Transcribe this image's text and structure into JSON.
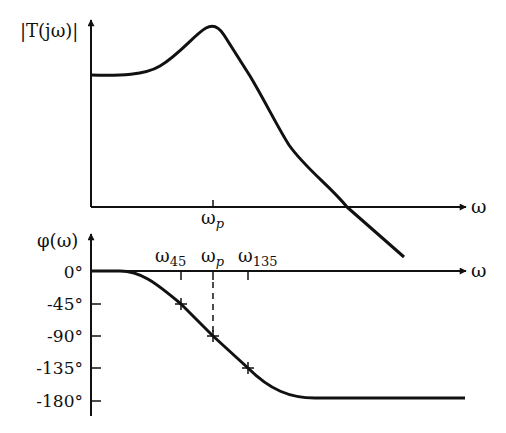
{
  "figure": {
    "type": "bode-plot-sketch",
    "magnitude_plot": {
      "ylabel": "|T(jω)|",
      "xlabel": "ω",
      "tick_label": "ωp",
      "curve": "flat low-frequency gain, resonant peak at ωp, then roll-off crossing the axis"
    },
    "phase_plot": {
      "ylabel": "φ(ω)",
      "xlabel": "ω",
      "y_ticks": [
        "0°",
        "-45°",
        "-90°",
        "-135°",
        "-180°"
      ],
      "x_ticks": [
        "ω45",
        "ωp",
        "ω135"
      ],
      "marked_points": [
        {
          "x": "ω45",
          "phase": "-45°"
        },
        {
          "x": "ωp",
          "phase": "-90°"
        },
        {
          "x": "ω135",
          "phase": "-135°"
        }
      ]
    }
  },
  "labels": {
    "mag_y": "|T(jω)|",
    "omega": "ω",
    "omega_p": "ω",
    "p_sub": "p",
    "phi_y": "φ(ω)",
    "sub45": "45",
    "sub135": "135",
    "t0": "0°",
    "t45": "-45°",
    "t90": "-90°",
    "t135": "-135°",
    "t180": "-180°"
  },
  "colors": {
    "ink": "#111111",
    "background": "#ffffff"
  }
}
